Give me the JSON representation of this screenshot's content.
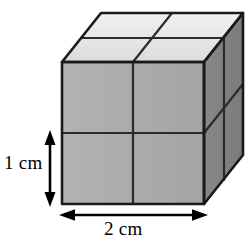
{
  "figure": {
    "type": "3d-solid-diagram",
    "shape": "rectangular-prism",
    "labels": {
      "height": "1 cm",
      "width": "2 cm"
    },
    "dimensions": {
      "width_cm": 2,
      "height_cm": 1,
      "depth_cm": 1,
      "unit": "cm",
      "cubes_across": 2,
      "cubes_high": 2,
      "cubes_deep": 1
    },
    "colors": {
      "top_face": "#e4e4e4",
      "front_face": "#ababab",
      "right_face": "#808080",
      "outline": "#1a1a1a",
      "divider": "#2b2b2b",
      "arrow": "#000000",
      "background": "#ffffff"
    },
    "geometry": {
      "front_left": 62,
      "front_right": 204,
      "front_top": 62,
      "front_bottom": 204,
      "depth_dx": 39,
      "depth_dy": -49
    },
    "arrows": {
      "height_arrow": {
        "orientation": "vertical",
        "x": 50,
        "y_top": 133,
        "y_bottom": 204,
        "double_headed": true
      },
      "width_arrow": {
        "orientation": "horizontal",
        "y": 215,
        "x_left": 62,
        "x_right": 204,
        "double_headed": true
      }
    }
  }
}
